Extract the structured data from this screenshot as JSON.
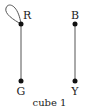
{
  "diagram": {
    "caption": "cube 1",
    "colors": {
      "edge": "#555555",
      "node": "#111111",
      "text": "#222222"
    },
    "nodes": [
      {
        "id": "R",
        "label": "R",
        "x": 21,
        "y": 24
      },
      {
        "id": "G",
        "label": "G",
        "x": 21,
        "y": 81
      },
      {
        "id": "B",
        "label": "B",
        "x": 75,
        "y": 24
      },
      {
        "id": "Y",
        "label": "Y",
        "x": 75,
        "y": 81
      }
    ],
    "edges": [
      {
        "from": "R",
        "to": "R",
        "type": "loop"
      },
      {
        "from": "R",
        "to": "G",
        "type": "line"
      },
      {
        "from": "B",
        "to": "Y",
        "type": "line"
      }
    ]
  }
}
